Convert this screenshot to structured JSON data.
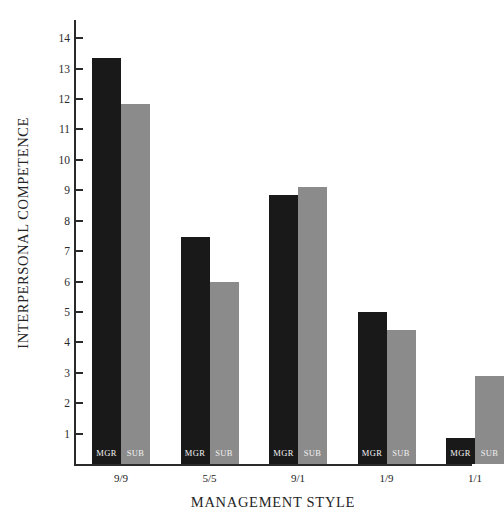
{
  "chart_data": {
    "type": "bar",
    "title": "",
    "xlabel": "MANAGEMENT STYLE",
    "ylabel": "INTERPERSONAL COMPETENCE",
    "categories": [
      "9/9",
      "5/5",
      "9/1",
      "1/9",
      "1/1"
    ],
    "series": [
      {
        "name": "MGR",
        "color": "#191919",
        "values": [
          13.35,
          7.45,
          8.85,
          5.0,
          0.85
        ]
      },
      {
        "name": "SUB",
        "color": "#8b8b8b",
        "values": [
          11.85,
          6.0,
          9.1,
          4.4,
          2.9
        ]
      }
    ],
    "ylim": [
      0,
      14.6
    ],
    "yticks": [
      1,
      2,
      3,
      4,
      5,
      6,
      7,
      8,
      9,
      10,
      11,
      12,
      13,
      14
    ],
    "ytick_labels": [
      "1",
      "2",
      "3",
      "4",
      "5",
      "6",
      "7",
      "8",
      "9",
      "10",
      "11",
      "12",
      "13",
      "14"
    ],
    "grid": false,
    "legend": "in-bar",
    "bar_labels": [
      "MGR",
      "SUB"
    ],
    "axis_color": "#2a2a2a",
    "background": "#ffffff"
  }
}
